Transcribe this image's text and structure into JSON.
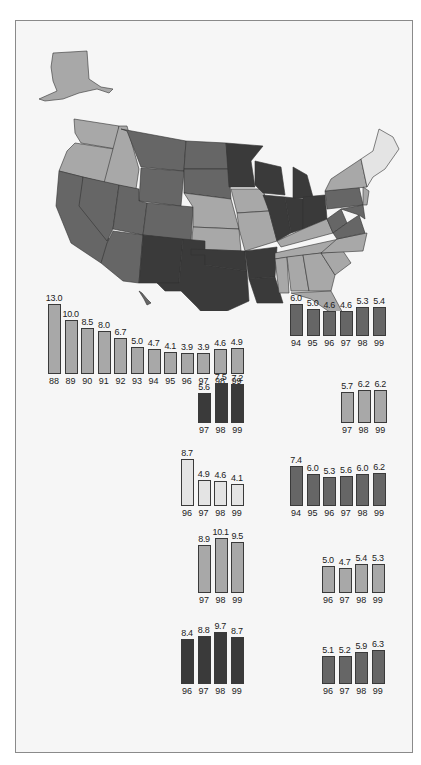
{
  "colors": {
    "darkest": "#3a3a3a",
    "dark": "#666666",
    "medium": "#a8a8a8",
    "light": "#e4e4e4",
    "frame_bg": "#f6f6f6",
    "border": "#8a8a8a"
  },
  "map": {
    "title": "United States choropleth map (4 shade levels)",
    "legend_levels": [
      "darkest",
      "dark",
      "medium",
      "light"
    ]
  },
  "chart_data": [
    {
      "id": "c1",
      "type": "bar",
      "shade": "medium",
      "categories": [
        "88",
        "89",
        "90",
        "91",
        "92",
        "93",
        "94",
        "95",
        "96",
        "97",
        "98",
        "99"
      ],
      "values": [
        13.0,
        10.0,
        8.5,
        8.0,
        6.7,
        5.0,
        4.7,
        4.1,
        3.9,
        3.9,
        4.6,
        4.9
      ],
      "labels": [
        "13.0",
        "10.0",
        "8.5",
        "8.0",
        "6.7",
        "5.0",
        "4.7",
        "4.1",
        "3.9",
        "3.9",
        "4.6",
        "4.9"
      ]
    },
    {
      "id": "c2",
      "type": "bar",
      "shade": "dark",
      "categories": [
        "94",
        "95",
        "96",
        "97",
        "98",
        "99"
      ],
      "values": [
        6.0,
        5.0,
        4.6,
        4.6,
        5.3,
        5.4
      ],
      "labels": [
        "6.0",
        "5.0",
        "4.6",
        "4.6",
        "5.3",
        "5.4"
      ]
    },
    {
      "id": "c3",
      "type": "bar",
      "shade": "darkest",
      "categories": [
        "97",
        "98",
        "99"
      ],
      "values": [
        5.6,
        7.5,
        7.2
      ],
      "labels": [
        "5.6",
        "7.5",
        "7.2"
      ]
    },
    {
      "id": "c4",
      "type": "bar",
      "shade": "medium",
      "categories": [
        "97",
        "98",
        "99"
      ],
      "values": [
        5.7,
        6.2,
        6.2
      ],
      "labels": [
        "5.7",
        "6.2",
        "6.2"
      ]
    },
    {
      "id": "c5",
      "type": "bar",
      "shade": "light",
      "categories": [
        "96",
        "97",
        "98",
        "99"
      ],
      "values": [
        8.7,
        4.9,
        4.6,
        4.1
      ],
      "labels": [
        "8.7",
        "4.9",
        "4.6",
        "4.1"
      ]
    },
    {
      "id": "c6",
      "type": "bar",
      "shade": "dark",
      "categories": [
        "94",
        "95",
        "96",
        "97",
        "98",
        "99"
      ],
      "values": [
        7.4,
        6.0,
        5.3,
        5.6,
        6.0,
        6.2
      ],
      "labels": [
        "7.4",
        "6.0",
        "5.3",
        "5.6",
        "6.0",
        "6.2"
      ]
    },
    {
      "id": "c7",
      "type": "bar",
      "shade": "medium",
      "categories": [
        "97",
        "98",
        "99"
      ],
      "values": [
        8.9,
        10.1,
        9.5
      ],
      "labels": [
        "8.9",
        "10.1",
        "9.5"
      ]
    },
    {
      "id": "c8",
      "type": "bar",
      "shade": "medium",
      "categories": [
        "96",
        "97",
        "98",
        "99"
      ],
      "values": [
        5.0,
        4.7,
        5.4,
        5.3
      ],
      "labels": [
        "5.0",
        "4.7",
        "5.4",
        "5.3"
      ]
    },
    {
      "id": "c9",
      "type": "bar",
      "shade": "darkest",
      "categories": [
        "96",
        "97",
        "98",
        "99"
      ],
      "values": [
        8.4,
        8.8,
        9.7,
        8.7
      ],
      "labels": [
        "8.4",
        "8.8",
        "9.7",
        "8.7"
      ]
    },
    {
      "id": "c10",
      "type": "bar",
      "shade": "dark",
      "categories": [
        "96",
        "97",
        "98",
        "99"
      ],
      "values": [
        5.1,
        5.2,
        5.9,
        6.3
      ],
      "labels": [
        "5.1",
        "5.2",
        "5.9",
        "6.3"
      ]
    }
  ]
}
